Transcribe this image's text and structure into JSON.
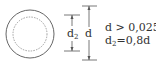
{
  "diagram": {
    "type": "pipe-cross-section",
    "outer_circle": {
      "label": "d",
      "style": "solid"
    },
    "inner_circle": {
      "label": "d2",
      "style": "dashed"
    },
    "dimensions": {
      "inner": {
        "base": "d",
        "sub": "2"
      },
      "outer": {
        "base": "d"
      }
    },
    "formulas": [
      {
        "text": "d > 0,025L"
      },
      {
        "base": "d",
        "sub": "2",
        "rest": "=0,8d"
      }
    ],
    "colors": {
      "stroke": "#555555",
      "text": "#333333"
    }
  }
}
